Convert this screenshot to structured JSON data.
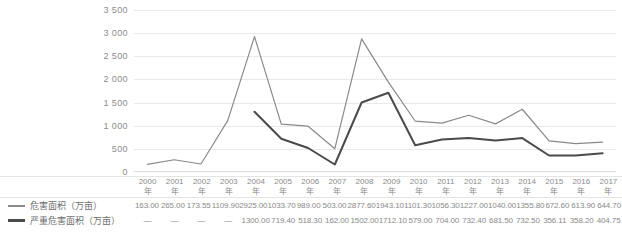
{
  "chart_data": {
    "type": "line",
    "title": "",
    "xlabel": "",
    "ylabel": "",
    "ylim": [
      0,
      3500
    ],
    "ytick_step": 500,
    "grid": true,
    "legend_position": "table-left",
    "year_suffix": "年",
    "missing_marker": "—",
    "categories": [
      "2000",
      "2001",
      "2002",
      "2003",
      "2004",
      "2005",
      "2006",
      "2007",
      "2008",
      "2009",
      "2010",
      "2011",
      "2012",
      "2013",
      "2014",
      "2015",
      "2016",
      "2017"
    ],
    "ytick_labels": [
      "3 500",
      "3 000",
      "2 500",
      "2 000",
      "1 500",
      "1 000",
      "500",
      "0"
    ],
    "ytick_values": [
      3500,
      3000,
      2500,
      2000,
      1500,
      1000,
      500,
      0
    ],
    "series": [
      {
        "name": "危害面积（万亩）",
        "color": "#8a8a8a",
        "values": [
          163.0,
          265.0,
          173.55,
          1109.9,
          2925.0,
          1033.7,
          989.0,
          503.0,
          2877.6,
          1943.1,
          1101.3,
          1056.3,
          1227.0,
          1040.0,
          1355.8,
          672.6,
          613.9,
          644.7
        ],
        "labels": [
          "163.00",
          "265.00",
          "173.55",
          "1109.90",
          "2925.00",
          "1033.70",
          "989.00",
          "503.00",
          "2877.60",
          "1943.10",
          "1101.30",
          "1056.30",
          "1227.00",
          "1040.00",
          "1355.80",
          "672.60",
          "613.90",
          "644.70"
        ]
      },
      {
        "name": "严重危害面积（万亩）",
        "color": "#4a4a4a",
        "values": [
          null,
          null,
          null,
          null,
          1300.0,
          719.4,
          518.3,
          162.0,
          1502.0,
          1712.1,
          579.0,
          704.0,
          732.4,
          681.5,
          732.5,
          356.11,
          358.2,
          404.75
        ],
        "labels": [
          "—",
          "—",
          "—",
          "—",
          "1300.00",
          "719.40",
          "518.30",
          "162.00",
          "1502.00",
          "1712.10",
          "579.00",
          "704.00",
          "732.40",
          "681.50",
          "732.50",
          "356.11",
          "358.20",
          "404.75"
        ]
      }
    ]
  }
}
